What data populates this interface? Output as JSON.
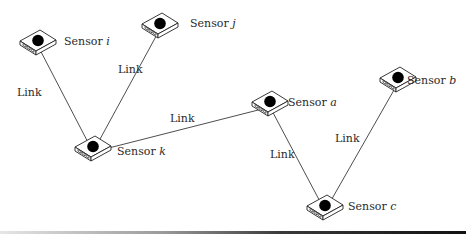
{
  "diagram": {
    "type": "sensor-network",
    "nodes": [
      {
        "id": "i",
        "prefix": "Sensor",
        "var": "i",
        "x": 38,
        "y": 42,
        "label_x": 64,
        "label_y": 36
      },
      {
        "id": "j",
        "prefix": "Sensor",
        "var": "j",
        "x": 160,
        "y": 25,
        "label_x": 190,
        "label_y": 18
      },
      {
        "id": "k",
        "prefix": "Sensor",
        "var": "k",
        "x": 93,
        "y": 148,
        "label_x": 117,
        "label_y": 146
      },
      {
        "id": "a",
        "prefix": "Sensor",
        "var": "a",
        "x": 270,
        "y": 103,
        "label_x": 288,
        "label_y": 97
      },
      {
        "id": "b",
        "prefix": "Sensor",
        "var": "b",
        "x": 398,
        "y": 79,
        "label_x": 407,
        "label_y": 75
      },
      {
        "id": "c",
        "prefix": "Sensor",
        "var": "c",
        "x": 325,
        "y": 207,
        "label_x": 348,
        "label_y": 201
      }
    ],
    "links": [
      {
        "from": "i",
        "to": "k",
        "label": "Link",
        "label_x": 17,
        "label_y": 87
      },
      {
        "from": "j",
        "to": "k",
        "label": "Link",
        "label_x": 118,
        "label_y": 64
      },
      {
        "from": "k",
        "to": "a",
        "label": "Link",
        "label_x": 170,
        "label_y": 113
      },
      {
        "from": "a",
        "to": "c",
        "label": "Link",
        "label_x": 270,
        "label_y": 149
      },
      {
        "from": "b",
        "to": "c",
        "label": "Link",
        "label_x": 335,
        "label_y": 133
      }
    ],
    "colors": {
      "line": "#3a3a3a",
      "device_fill": "#ffffff",
      "device_stroke": "#222222",
      "sensor_dot": "#000000"
    }
  }
}
